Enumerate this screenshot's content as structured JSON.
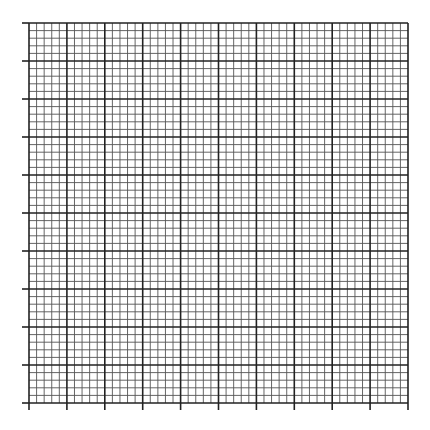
{
  "grid": {
    "left": 29,
    "top": 23,
    "right": 408,
    "bottom": 403,
    "major_divisions_x": 10,
    "major_divisions_y": 10,
    "minor_per_major": 5,
    "tick_length": 7,
    "minor_color": "#555555",
    "major_color": "#222222",
    "background": "#ffffff"
  }
}
